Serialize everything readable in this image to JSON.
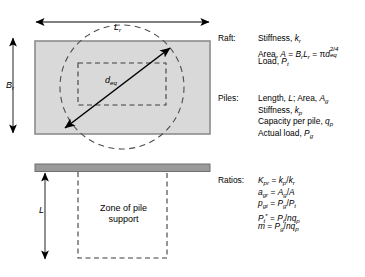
{
  "figure": {
    "colors": {
      "raft_fill": "#d9d9d9",
      "raft_outline": "#808080",
      "bar_fill": "#9a9a9a",
      "dashed": "#4d4d4d",
      "arrow": "#000000",
      "text": "#000000",
      "background": "#ffffff"
    }
  },
  "plan_view": {
    "width_label": "L",
    "width_sub": "r",
    "height_label": "B",
    "height_sub": "r",
    "diagonal_label": "d",
    "diagonal_sub": "eq"
  },
  "section_view": {
    "depth_label": "L",
    "zone_line1": "Zone of pile",
    "zone_line2": "support"
  },
  "notes": {
    "raft": {
      "label": "Raft:",
      "lines": [
        {
          "text": "Stiffness, k",
          "sub": "r"
        },
        {
          "text": "Area, A = B",
          "sub": "r"
        },
        {
          "text": "Load, P",
          "sub": "t"
        }
      ],
      "area_formula": "Area, A = BrLr = πd_eq^2/4",
      "stiffness_formula": "Stiffness, kr",
      "load_formula": "Load, Pt"
    },
    "piles": {
      "label": "Piles:",
      "lines": [
        "Length, L; Area, Ag",
        "Stiffness, kp",
        "Capacity per pile, qp",
        "Actual load, Pg"
      ]
    },
    "ratios": {
      "label": "Ratios:",
      "lines": [
        "Kpr = kp/kr",
        "agr = Ag/A",
        "pgt = Pg/Pt",
        "Pt* = Pt/nqp",
        "m = Pg/nqp"
      ]
    }
  },
  "text_fragments": {
    "raft_label": "Raft:",
    "piles_label": "Piles:",
    "ratios_label": "Ratios:",
    "stiffness": "Stiffness,",
    "area": "Area,",
    "load": "Load,",
    "length": "Length,",
    "area_semi": "; Area,",
    "capacity": "Capacity per pile,",
    "actual_load": "Actual load,",
    "zone_of_pile": "Zone of pile",
    "support": "support"
  }
}
